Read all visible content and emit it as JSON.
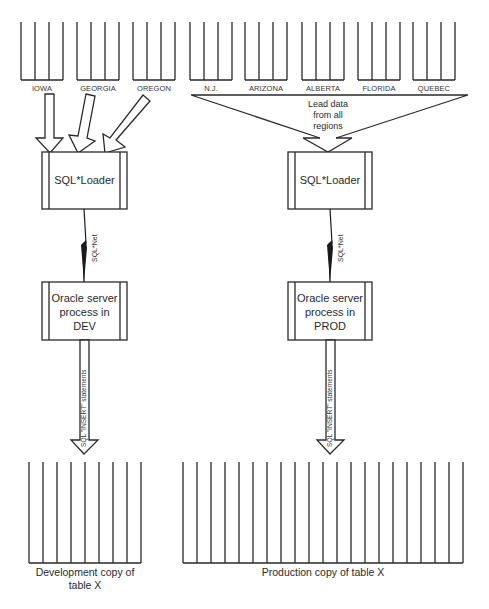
{
  "regions": [
    {
      "label": "IOWA"
    },
    {
      "label": "GEORGIA"
    },
    {
      "label": "OREGON"
    },
    {
      "label": "N.J."
    },
    {
      "label": "ARIZONA"
    },
    {
      "label": "ALBERTA"
    },
    {
      "label": "FLORIDA"
    },
    {
      "label": "QUEBEC"
    }
  ],
  "funnel": {
    "label_line1": "Lead data",
    "label_line2": "from all",
    "label_line3": "regions"
  },
  "dev": {
    "loader": {
      "label": "SQL*Loader"
    },
    "net_label": "SQL*Net",
    "server": {
      "line1": "Oracle server",
      "line2": "process in",
      "line3": "DEV"
    },
    "insert_label": "SQL \"INSERT\" statements",
    "table": {
      "line1": "Development copy of",
      "line2": "table X"
    }
  },
  "prod": {
    "loader": {
      "label": "SQL*Loader"
    },
    "net_label": "SQL*Net",
    "server": {
      "line1": "Oracle server",
      "line2": "process in",
      "line3": "PROD"
    },
    "insert_label": "SQL \"INSERT\" statements",
    "table": {
      "line1": "Production copy of table X"
    }
  }
}
